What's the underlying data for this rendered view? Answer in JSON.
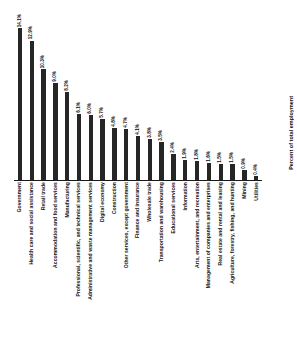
{
  "chart_data": {
    "type": "bar",
    "title": "",
    "subtitle": "",
    "xlabel": "",
    "ylabel": "Percent of total employment",
    "ylim": [
      0,
      14.1
    ],
    "grid": false,
    "legend": null,
    "orientation": "vertical",
    "value_suffix": "%",
    "categories": [
      "Government",
      "Health care and social assistance",
      "Retail trade",
      "Accommodation and food services",
      "Manufacturing",
      "Professional, scientific, and technical services",
      "Administrative and waste management services",
      "Digital economy",
      "Construction",
      "Other services, except government",
      "Finance and insurance",
      "Wholesale trade",
      "Transportation and warehousing",
      "Educational services",
      "Information",
      "Arts, entertainment, and recreation",
      "Management of companies and enterprises",
      "Real estate and rental and leasing",
      "Agriculture, forestry, fishing, and hunting",
      "Mining",
      "Utilities"
    ],
    "values": [
      14.1,
      12.9,
      10.3,
      9.0,
      8.2,
      6.1,
      6.0,
      5.7,
      4.8,
      4.7,
      4.1,
      3.8,
      3.5,
      2.4,
      1.9,
      1.8,
      1.6,
      1.5,
      1.5,
      0.9,
      0.4
    ],
    "value_labels": [
      "14.1%",
      "12.9%",
      "10.3%",
      "9.0%",
      "8.2%",
      "6.1%",
      "6.0%",
      "5.7%",
      "4.8%",
      "4.7%",
      "4.1%",
      "3.8%",
      "3.5%",
      "2.4%",
      "1.9%",
      "1.8%",
      "1.6%",
      "1.5%",
      "1.5%",
      "0.9%",
      "0.4%"
    ],
    "bar_color": "#262626",
    "background_color": "#ffffff"
  }
}
